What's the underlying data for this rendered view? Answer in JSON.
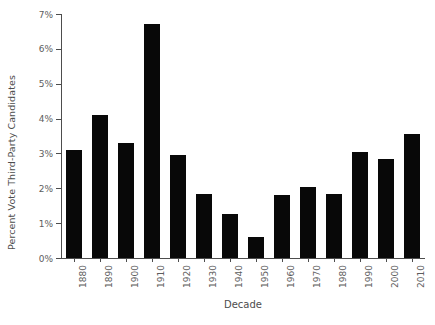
{
  "chart_data": {
    "type": "bar",
    "title": "",
    "subtitle": "",
    "xlabel": "Decade",
    "ylabel": "Percent Vote Third-Party Candidates",
    "categories": [
      "1880",
      "1890",
      "1900",
      "1910",
      "1920",
      "1930",
      "1940",
      "1950",
      "1960",
      "1970",
      "1980",
      "1990",
      "2000",
      "2010"
    ],
    "values": [
      3.1,
      4.1,
      3.3,
      6.7,
      2.95,
      1.85,
      1.25,
      0.6,
      1.8,
      2.05,
      1.85,
      3.05,
      2.85,
      3.55
    ],
    "ylim": [
      0,
      7
    ],
    "ytick_values": [
      0,
      1,
      2,
      3,
      4,
      5,
      6,
      7
    ],
    "ytick_labels": [
      "0%",
      "1%",
      "2%",
      "3%",
      "4%",
      "5%",
      "6%",
      "7%"
    ],
    "grid": false,
    "legend": false,
    "legend_position": "none",
    "bar_color": "#080808",
    "axis_color": "#4d4d4d",
    "background_color": "#ffffff"
  }
}
